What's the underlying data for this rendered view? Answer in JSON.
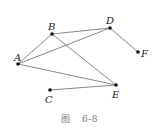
{
  "diagram": {
    "type": "graph",
    "nodes": [
      {
        "id": "A",
        "label": "A",
        "x": 18,
        "y": 64
      },
      {
        "id": "B",
        "label": "B",
        "x": 52,
        "y": 34
      },
      {
        "id": "C",
        "label": "C",
        "x": 50,
        "y": 90
      },
      {
        "id": "D",
        "label": "D",
        "x": 110,
        "y": 28
      },
      {
        "id": "E",
        "label": "E",
        "x": 116,
        "y": 85
      },
      {
        "id": "F",
        "label": "F",
        "x": 138,
        "y": 52
      }
    ],
    "edges": [
      [
        "A",
        "B"
      ],
      [
        "A",
        "D"
      ],
      [
        "A",
        "E"
      ],
      [
        "B",
        "D"
      ],
      [
        "B",
        "E"
      ],
      [
        "D",
        "F"
      ],
      [
        "C",
        "E"
      ]
    ]
  },
  "caption": {
    "prefix": "图",
    "number": "6-8"
  }
}
